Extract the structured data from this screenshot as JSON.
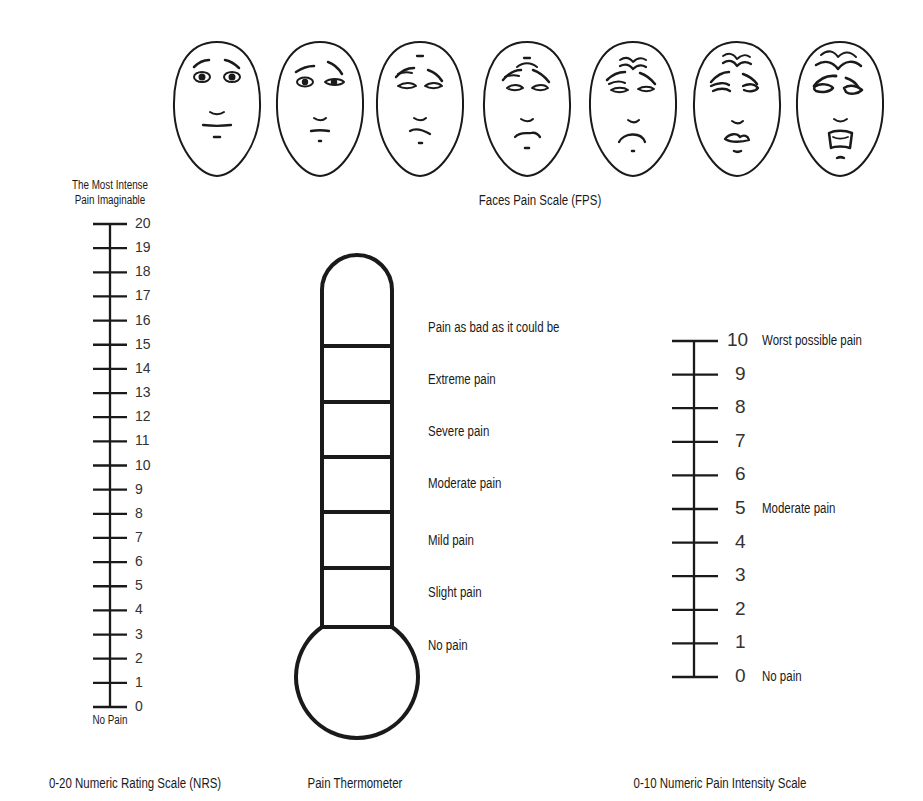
{
  "faces_scale": {
    "caption": "Faces Pain Scale (FPS)",
    "faces": [
      {
        "index": 0,
        "expression": "neutral"
      },
      {
        "index": 1,
        "expression": "slight-discomfort"
      },
      {
        "index": 2,
        "expression": "mild-pain"
      },
      {
        "index": 3,
        "expression": "moderate-pain"
      },
      {
        "index": 4,
        "expression": "significant-pain"
      },
      {
        "index": 5,
        "expression": "severe-pain"
      },
      {
        "index": 6,
        "expression": "worst-pain"
      }
    ]
  },
  "nrs_scale": {
    "caption": "0-20 Numeric Rating Scale (NRS)",
    "top_label_line1": "The Most Intense",
    "top_label_line2": "Pain Imaginable",
    "bottom_label": "No Pain",
    "ticks": [
      "20",
      "19",
      "18",
      "17",
      "16",
      "15",
      "14",
      "13",
      "12",
      "11",
      "10",
      "9",
      "8",
      "7",
      "6",
      "5",
      "4",
      "3",
      "2",
      "1",
      "0"
    ]
  },
  "thermometer": {
    "caption": "Pain Thermometer",
    "levels": [
      "Pain as bad as it could be",
      "Extreme pain",
      "Severe pain",
      "Moderate pain",
      "Mild pain",
      "Slight pain",
      "No pain"
    ]
  },
  "npis_scale": {
    "caption": "0-10 Numeric Pain Intensity Scale",
    "ticks": [
      "10",
      "9",
      "8",
      "7",
      "6",
      "5",
      "4",
      "3",
      "2",
      "1",
      "0"
    ],
    "anchors": {
      "10": "Worst possible pain",
      "5": "Moderate pain",
      "0": "No pain"
    }
  },
  "colors": {
    "ink": "#1a1a1a",
    "background": "#ffffff"
  }
}
